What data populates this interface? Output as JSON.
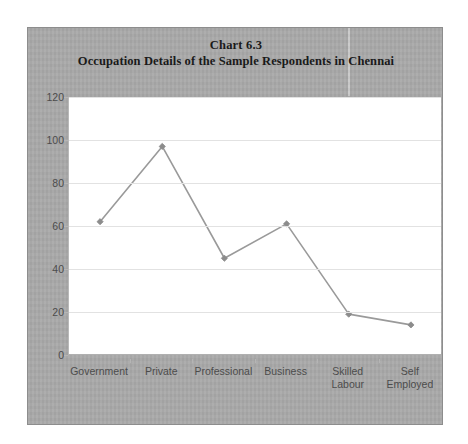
{
  "chart_data": {
    "type": "line",
    "title": "Chart 6.3",
    "subtitle": "Occupation Details of the Sample Respondents in Chennai",
    "categories": [
      "Government",
      "Private",
      "Professional",
      "Business",
      "Skilled\nLabour",
      "Self\nEmployed"
    ],
    "values": [
      62,
      97,
      45,
      61,
      19,
      14
    ],
    "series": [
      {
        "name": "Respondents",
        "values": [
          62,
          97,
          45,
          61,
          19,
          14
        ]
      }
    ],
    "xlabel": "",
    "ylabel": "",
    "ylim": [
      0,
      120
    ],
    "yticks": [
      0,
      20,
      40,
      60,
      80,
      100,
      120
    ],
    "ytick_labels": [
      "0",
      "20",
      "40",
      "60",
      "80",
      "100",
      "120"
    ],
    "grid": true,
    "gridlines": "horizontal",
    "legend": false,
    "legend_position": "none",
    "marker": "diamond",
    "line_color": "#9a9a9a",
    "marker_color": "#8c8c8c",
    "plot_background": "#ffffff",
    "chart_background": "#a9a9a9",
    "grid_color": "#e2e2e2",
    "axis_color": "#b5b5b5",
    "title_color": "#1a1a1a",
    "tick_label_color": "#4c4c4c"
  }
}
